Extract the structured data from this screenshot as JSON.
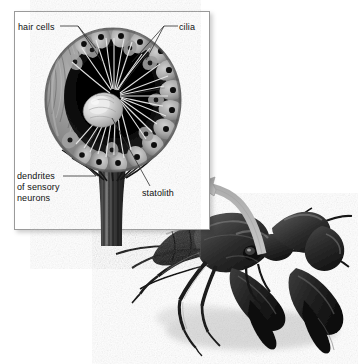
{
  "figure": {
    "name": "crayfish-statocyst-diagram",
    "background_color": "#ffffff"
  },
  "inset": {
    "name": "statocyst-inset-panel",
    "border_color": "#9a9a9a",
    "fill_color": "#ffffff",
    "x": 14,
    "y": 11,
    "width": 196,
    "height": 219
  },
  "labels": {
    "hair_cells": "hair cells",
    "cilia": "cilia",
    "statolith": "statolith",
    "dendrites_line1": "dendrites",
    "dendrites_line2": "of sensory",
    "dendrites_line3": "neurons"
  },
  "leader_lines": {
    "color": "#333333",
    "width": 0.8
  },
  "statocyst": {
    "name": "statocyst-sac",
    "shape": "round sac",
    "lumen_color": "#0d0d0d",
    "wall_color": "#8d8d8d",
    "hair_cell_color": "#b4b4b4",
    "nucleus_color": "#121212",
    "cilia_color": "#e8e8e8",
    "statolith_color": "#dedede",
    "hair_cell_count": 22,
    "cilia_count": 26
  },
  "arrow": {
    "name": "zoom-callout-arrow",
    "color": "#b9b9b9",
    "stroke_color": "#9d9d9d",
    "direction": "from crayfish head up-left to inset"
  },
  "crayfish": {
    "name": "crayfish-illustration",
    "body_color": "#2b2b2b",
    "highlight_color": "#8e8e8e",
    "shadow_color": "#d8d8d8",
    "parts": [
      "carapace",
      "cheliped",
      "antenna",
      "walking legs",
      "abdomen",
      "eye"
    ]
  }
}
